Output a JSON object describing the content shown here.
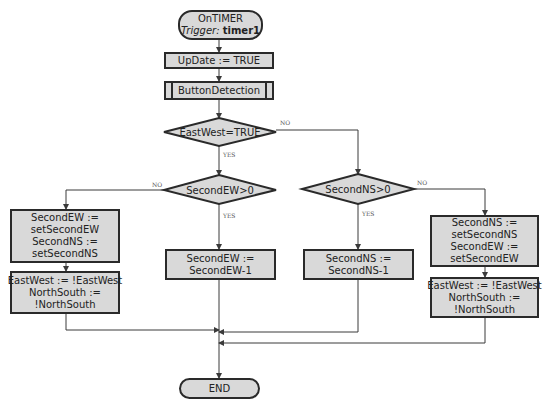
{
  "start": {
    "title": "OnTIMER",
    "trigger_label": "Trigger:",
    "trigger_value": "timer1"
  },
  "update": {
    "lines": [
      "UpDate := TRUE"
    ]
  },
  "subroutine": {
    "label": "ButtonDetection"
  },
  "decisions": {
    "eastwest": {
      "label": "EastWest=TRUE",
      "yes": "YES",
      "no": "NO"
    },
    "second_ew": {
      "label": "SecondEW>0",
      "yes": "YES",
      "no": "NO"
    },
    "second_ns": {
      "label": "SecondNS>0",
      "yes": "YES",
      "no": "NO"
    }
  },
  "processes": {
    "reset_ew": {
      "lines": [
        "SecondEW :=",
        "setSecondEW",
        "SecondNS :=",
        "setSecondNS"
      ]
    },
    "toggle_left": {
      "lines": [
        "EastWest := !EastWest",
        "NorthSouth :=",
        "!NorthSouth"
      ]
    },
    "dec_ew": {
      "lines": [
        "SecondEW :=",
        "SecondEW-1"
      ]
    },
    "dec_ns": {
      "lines": [
        "SecondNS :=",
        "SecondNS-1"
      ]
    },
    "reset_ns": {
      "lines": [
        "SecondNS :=",
        "setSecondNS",
        "SecondEW :=",
        "setSecondEW"
      ]
    },
    "toggle_right": {
      "lines": [
        "EastWest := !EastWest",
        "NorthSouth :=",
        "!NorthSouth"
      ]
    }
  },
  "end": {
    "label": "END"
  },
  "colors": {
    "fill": "#d9d9d9",
    "stroke": "#2a2a2a",
    "wire": "#3a3a3a"
  }
}
